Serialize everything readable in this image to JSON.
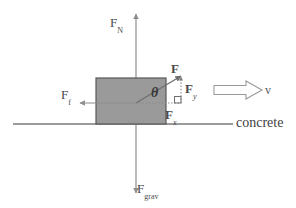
{
  "diagram": {
    "surface_label": "concrete",
    "angle_symbol": "θ",
    "velocity_label": "v",
    "colors": {
      "box_fill": "#9a9a9a",
      "box_stroke": "#595959",
      "axis": "#8d8d8d",
      "ground": "#7a7a7a",
      "vector": "#6f6f6f",
      "text": "#4a4a4a"
    },
    "forces": [
      {
        "id": "normal",
        "base": "F",
        "sub": "N",
        "label": "F_N",
        "direction": "up"
      },
      {
        "id": "gravity",
        "base": "F",
        "sub": "grav",
        "label": "F_grav",
        "direction": "down"
      },
      {
        "id": "friction",
        "base": "F",
        "sub": "f",
        "label": "F_f",
        "direction": "left"
      },
      {
        "id": "applied",
        "base": "F",
        "sub": "",
        "label": "F",
        "direction": "up-right"
      },
      {
        "id": "applied-x",
        "base": "F",
        "sub": "x",
        "label": "F_x",
        "direction": "right"
      },
      {
        "id": "applied-y",
        "base": "F",
        "sub": "y",
        "label": "F_y",
        "direction": "up"
      }
    ]
  }
}
